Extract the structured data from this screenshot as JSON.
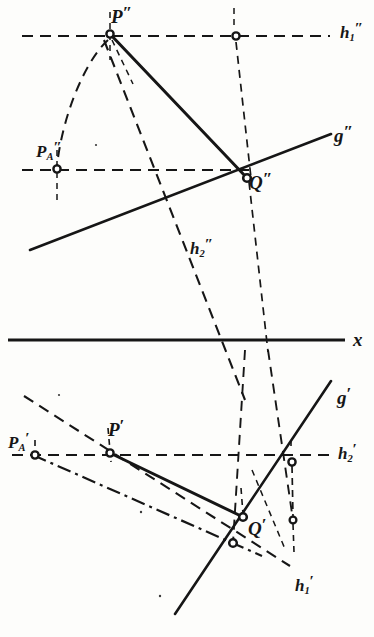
{
  "figure": {
    "kind": "descriptive-geometry-construction",
    "background_color": "#fdfdfb",
    "ink_color": "#161616",
    "labels": {
      "p_double_prime": {
        "base": "P",
        "sub": "",
        "prime": "″",
        "x": 111,
        "y": 4,
        "size": "lg"
      },
      "pa_double_prime": {
        "base": "P",
        "sub": "A",
        "prime": "″",
        "x": 36,
        "y": 139,
        "size": "md"
      },
      "q_double_prime": {
        "base": "Q",
        "sub": "",
        "prime": "″",
        "x": 249,
        "y": 170,
        "size": "lg"
      },
      "g_double_prime": {
        "base": "g",
        "sub": "",
        "prime": "″",
        "x": 334,
        "y": 123,
        "size": "lg"
      },
      "h1_double_prime": {
        "base": "h",
        "sub": "1",
        "prime": "″",
        "x": 340,
        "y": 20,
        "size": "md"
      },
      "h2_double_prime": {
        "base": "h",
        "sub": "2",
        "prime": "″",
        "x": 190,
        "y": 236,
        "size": "md"
      },
      "x_axis": {
        "base": "x",
        "sub": "",
        "prime": "",
        "x": 353,
        "y": 330,
        "size": "lg"
      },
      "p_prime": {
        "base": "P",
        "sub": "",
        "prime": "′",
        "x": 108,
        "y": 417,
        "size": "lg"
      },
      "pa_prime": {
        "base": "P",
        "sub": "A",
        "prime": "′",
        "x": 8,
        "y": 430,
        "size": "md"
      },
      "q_prime": {
        "base": "Q",
        "sub": "",
        "prime": "′",
        "x": 248,
        "y": 516,
        "size": "lg"
      },
      "g_prime": {
        "base": "g",
        "sub": "",
        "prime": "′",
        "x": 337,
        "y": 385,
        "size": "lg"
      },
      "h2_prime": {
        "base": "h",
        "sub": "2",
        "prime": "′",
        "x": 338,
        "y": 441,
        "size": "md"
      },
      "h1_prime": {
        "base": "h",
        "sub": "1",
        "prime": "′",
        "x": 295,
        "y": 573,
        "size": "md"
      }
    },
    "points": {
      "P_dd": {
        "x": 110,
        "y": 34
      },
      "PA_dd": {
        "x": 57,
        "y": 169
      },
      "Q_dd": {
        "x": 247,
        "y": 178
      },
      "H1_node_dd": {
        "x": 236,
        "y": 36
      },
      "P_d": {
        "x": 110,
        "y": 453
      },
      "PA_d": {
        "x": 35,
        "y": 455
      },
      "Q_d": {
        "x": 243,
        "y": 517
      },
      "H2_node_d": {
        "x": 292,
        "y": 462
      },
      "lower_node_d": {
        "x": 293,
        "y": 520
      },
      "cross_node_d": {
        "x": 233,
        "y": 543
      }
    },
    "lines": {
      "h1_double_prime": {
        "y": 36,
        "x1": 22,
        "x2": 330,
        "style": "dashed"
      },
      "h2_double_prime_horiz": {
        "y": 170,
        "x1": 22,
        "x2": 250,
        "style": "dashed"
      },
      "x_axis": {
        "y": 340,
        "x1": 8,
        "x2": 345,
        "style": "solid"
      },
      "h2_prime": {
        "y": 455,
        "x1": 12,
        "x2": 330,
        "style": "dashed"
      },
      "g_double_prime": {
        "x1": 30,
        "y1": 250,
        "x2": 331,
        "y2": 134,
        "style": "solid"
      },
      "PQ_double_prime": {
        "x1": 110,
        "y1": 34,
        "x2": 247,
        "y2": 178,
        "style": "solid"
      },
      "g_prime": {
        "x1": 175,
        "y1": 614,
        "x2": 330,
        "y2": 382,
        "style": "solid"
      },
      "PQ_prime": {
        "x1": 110,
        "y1": 453,
        "x2": 243,
        "y2": 517,
        "style": "solid"
      }
    }
  }
}
